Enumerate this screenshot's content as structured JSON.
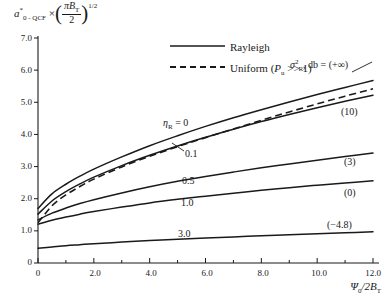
{
  "chart_data": {
    "type": "line",
    "title": "",
    "ylabel_text": "a*_{0-QCF} × (πB_T/2)^{1/2}",
    "xlabel_text": "Ψ_0/2B_T",
    "xlim": [
      0,
      12
    ],
    "ylim": [
      0,
      7.4
    ],
    "xticks": [
      0,
      2.0,
      4.0,
      6.0,
      8.0,
      10.0,
      12.0
    ],
    "xtick_labels": [
      "0",
      "2.0",
      "4.0",
      "6.0",
      "8.0",
      "10.0",
      "12.0"
    ],
    "xminorticks": [
      1.0,
      3.0,
      5.0,
      7.0,
      9.0,
      11.0
    ],
    "yticks": [
      0,
      1.0,
      2.0,
      3.0,
      4.0,
      5.0,
      6.0,
      7.0
    ],
    "ytick_labels": [
      "0",
      "1.0",
      "2.0",
      "3.0",
      "4.0",
      "5.0",
      "6.0",
      "7.0"
    ],
    "grid": false,
    "legend_position": "top-center",
    "annotation_top_right": "σ²_R, db = (+∞)",
    "series": [
      {
        "name": "eta_R = 0",
        "style": "solid",
        "label": "η_R = 0",
        "right_label": "",
        "x": [
          0,
          0.5,
          1.0,
          1.5,
          2.0,
          3.0,
          4.0,
          5.0,
          6.0,
          7.0,
          8.0,
          9.0,
          10.0,
          11.0,
          12.0
        ],
        "y": [
          1.7,
          2.15,
          2.45,
          2.7,
          2.92,
          3.3,
          3.65,
          3.96,
          4.25,
          4.52,
          4.77,
          5.01,
          5.24,
          5.46,
          5.68
        ]
      },
      {
        "name": "eta_R = 0.1",
        "style": "solid",
        "label": "0.1",
        "right_label": "(10)",
        "x": [
          0,
          0.5,
          1.0,
          1.5,
          2.0,
          3.0,
          4.0,
          5.0,
          6.0,
          7.0,
          8.0,
          9.0,
          10.0,
          11.0,
          12.0
        ],
        "y": [
          1.52,
          1.93,
          2.22,
          2.46,
          2.67,
          3.03,
          3.35,
          3.64,
          3.91,
          4.16,
          4.4,
          4.62,
          4.83,
          5.03,
          5.22
        ]
      },
      {
        "name": "uniform",
        "style": "dashed",
        "label": "Uniform (P_u >> 1)",
        "right_label": "",
        "x": [
          0,
          0.5,
          1.0,
          1.5,
          2.0,
          3.0,
          4.0,
          5.0,
          6.0,
          7.0,
          8.0,
          9.0,
          10.0,
          11.0,
          12.0
        ],
        "y": [
          1.25,
          1.78,
          2.12,
          2.38,
          2.61,
          2.99,
          3.32,
          3.62,
          3.9,
          4.17,
          4.44,
          4.7,
          4.95,
          5.19,
          5.42
        ]
      },
      {
        "name": "eta_R = 0.5",
        "style": "solid",
        "label": "0.5",
        "right_label": "(3)",
        "x": [
          0,
          0.5,
          1.0,
          1.5,
          2.0,
          3.0,
          4.0,
          5.0,
          6.0,
          7.0,
          8.0,
          9.0,
          10.0,
          11.0,
          12.0
        ],
        "y": [
          1.34,
          1.55,
          1.71,
          1.85,
          1.97,
          2.18,
          2.37,
          2.54,
          2.69,
          2.83,
          2.96,
          3.08,
          3.2,
          3.31,
          3.42
        ]
      },
      {
        "name": "eta_R = 1.0",
        "style": "solid",
        "label": "1.0",
        "right_label": "(0)",
        "x": [
          0,
          0.5,
          1.0,
          1.5,
          2.0,
          3.0,
          4.0,
          5.0,
          6.0,
          7.0,
          8.0,
          9.0,
          10.0,
          11.0,
          12.0
        ],
        "y": [
          1.21,
          1.33,
          1.43,
          1.52,
          1.6,
          1.74,
          1.87,
          1.98,
          2.08,
          2.17,
          2.26,
          2.34,
          2.42,
          2.49,
          2.56
        ]
      },
      {
        "name": "eta_R = 3.0",
        "style": "solid",
        "label": "3.0",
        "right_label": "(-4.8)",
        "x": [
          0,
          0.5,
          1.0,
          1.5,
          2.0,
          3.0,
          4.0,
          5.0,
          6.0,
          7.0,
          8.0,
          9.0,
          10.0,
          11.0,
          12.0
        ],
        "y": [
          0.46,
          0.5,
          0.54,
          0.57,
          0.6,
          0.65,
          0.7,
          0.74,
          0.78,
          0.81,
          0.85,
          0.88,
          0.91,
          0.94,
          0.97
        ]
      }
    ]
  },
  "ylabel": {
    "symbol": "a",
    "sub": "0 - QCF",
    "sup": "*",
    "times": "×",
    "numerator": "πB",
    "numerator_sub": "T",
    "denominator": "2",
    "exponent": "1/2"
  },
  "xlabel": {
    "symbol": "Ψ",
    "sub": "0",
    "rest": "/2B",
    "rest_sub": "T"
  },
  "legend": {
    "rayleigh": "Rayleigh",
    "uniform_prefix": "Uniform (",
    "uniform_symbol": "P",
    "uniform_sub": "u",
    "uniform_suffix": " >> 1)"
  },
  "annotation": {
    "sigma": "σ",
    "sigma_sup": "2",
    "sigma_sub": "R",
    "tail": ", db = (+∞)"
  },
  "curve_labels": {
    "eta_symbol": "η",
    "eta_sub": "R",
    "eta_value": " = 0",
    "v01": "0.1",
    "v05": "0.5",
    "v10": "1.0",
    "v30": "3.0",
    "r10": "(10)",
    "r3": "(3)",
    "r0": "(0)",
    "rneg": "(−4.8)"
  },
  "yticks": {
    "t0": "0",
    "t1": "1.0",
    "t2": "2.0",
    "t3": "3.0",
    "t4": "4.0",
    "t5": "5.0",
    "t6": "6.0",
    "t7": "7.0"
  },
  "xticks": {
    "t0": "0",
    "t2": "2.0",
    "t4": "4.0",
    "t6": "6.0",
    "t8": "8.0",
    "t10": "10.0",
    "t12": "12.0"
  }
}
